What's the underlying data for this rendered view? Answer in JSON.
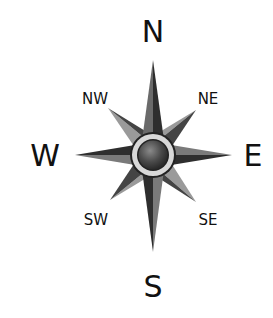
{
  "diagram": {
    "type": "compass-rose",
    "labels": {
      "n": "N",
      "s": "S",
      "e": "E",
      "w": "W",
      "ne": "NE",
      "nw": "NW",
      "se": "SE",
      "sw": "SW"
    },
    "colors": {
      "dark": "#2e2e2e",
      "mid": "#6a6a6a",
      "light": "#9a9a9a",
      "ring": "#d8d8d8",
      "center": "#4a4a4a"
    }
  }
}
